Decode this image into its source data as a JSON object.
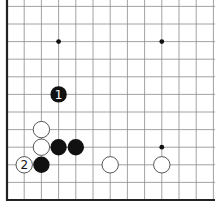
{
  "board": {
    "title": "Go board diagram (lower-left corner)",
    "colors": {
      "background": "#ffffff",
      "line": "#8a8a8a",
      "edge": "#222222",
      "black_stone": "#111111",
      "white_stone": "#ffffff",
      "white_stone_border": "#444444"
    },
    "grid": {
      "origin_x": 7,
      "step_x": 17.2,
      "cols": 13,
      "origin_y": 200,
      "step_y": 17.6,
      "rows": 12,
      "edges": [
        "left",
        "bottom"
      ]
    },
    "star_points": [
      {
        "col": 3,
        "row": 9
      },
      {
        "col": 9,
        "row": 9
      },
      {
        "col": 9,
        "row": 3
      }
    ],
    "stones": [
      {
        "color": "black",
        "col": 3,
        "row": 6,
        "label": "1"
      },
      {
        "color": "white",
        "col": 2,
        "row": 4,
        "label": ""
      },
      {
        "color": "white",
        "col": 2,
        "row": 3,
        "label": ""
      },
      {
        "color": "black",
        "col": 3,
        "row": 3,
        "label": ""
      },
      {
        "color": "black",
        "col": 4,
        "row": 3,
        "label": ""
      },
      {
        "color": "black",
        "col": 2,
        "row": 2,
        "label": ""
      },
      {
        "color": "white",
        "col": 1,
        "row": 2,
        "label": "2"
      },
      {
        "color": "white",
        "col": 6,
        "row": 2,
        "label": ""
      },
      {
        "color": "white",
        "col": 9,
        "row": 2,
        "label": ""
      }
    ]
  }
}
